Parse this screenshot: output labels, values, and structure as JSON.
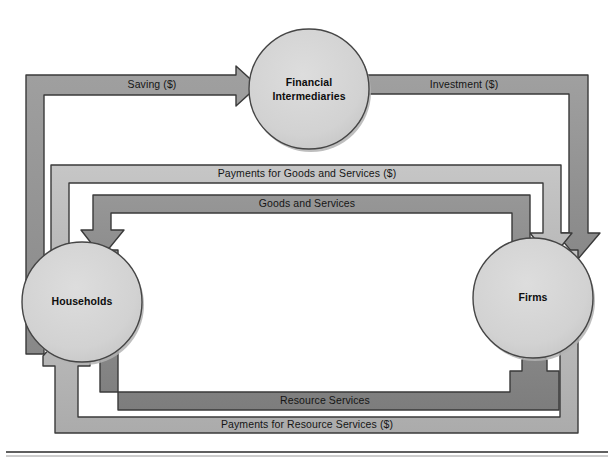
{
  "diagram": {
    "background": "#ffffff",
    "colors": {
      "band_light": "#b9b9b9",
      "band_mid": "#949494",
      "band_dark": "#8a8a8a",
      "band_darkest": "#7e7e7e",
      "node_fill": "#d3d3d3",
      "outline": "#3a3a3a",
      "text": "#111111",
      "rule": "#2b2b2b"
    },
    "nodes": [
      {
        "id": "financial-intermediaries",
        "line1": "Financial",
        "line2": "Intermediaries",
        "cx": 309,
        "cy": 89,
        "r": 60
      },
      {
        "id": "households",
        "line1": "Households",
        "line2": "",
        "cx": 82,
        "cy": 302,
        "r": 60
      },
      {
        "id": "firms",
        "line1": "Firms",
        "line2": "",
        "cx": 533,
        "cy": 298,
        "r": 60
      }
    ],
    "flows": [
      {
        "id": "saving",
        "label": "Saving ($)",
        "from": "households",
        "to": "financial-intermediaries",
        "label_x": 152,
        "label_y": 85,
        "tone": "band_mid"
      },
      {
        "id": "investment",
        "label": "Investment ($)",
        "from": "financial-intermediaries",
        "to": "firms",
        "label_x": 464,
        "label_y": 85,
        "tone": "band_mid"
      },
      {
        "id": "payments-goods",
        "label": "Payments for Goods and Services ($)",
        "from": "households",
        "to": "firms",
        "label_x": 307,
        "label_y": 174,
        "tone": "band_light"
      },
      {
        "id": "goods-services",
        "label": "Goods and Services",
        "from": "firms",
        "to": "households",
        "label_x": 307,
        "label_y": 203,
        "tone": "band_dark"
      },
      {
        "id": "resource-services",
        "label": "Resource Services",
        "from": "households",
        "to": "firms",
        "label_x": 325,
        "label_y": 401,
        "tone": "band_dark"
      },
      {
        "id": "payments-resources",
        "label": "Payments for Resource Services ($)",
        "from": "firms",
        "to": "households",
        "label_x": 307,
        "label_y": 425,
        "tone": "band_light"
      }
    ],
    "rules": [
      {
        "id": "bottom-rule",
        "y": 452
      }
    ]
  }
}
